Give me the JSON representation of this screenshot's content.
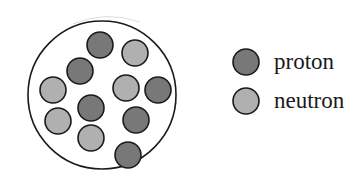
{
  "figure": {
    "width": 363,
    "height": 189,
    "background_color": "#ffffff"
  },
  "colors": {
    "proton_fill": "#787878",
    "neutron_fill": "#b0b0b0",
    "particle_stroke": "#1a1a1a",
    "nucleus_stroke": "#1a1a1a",
    "nucleus_fill": "#ffffff",
    "text_color": "#1a1a1a"
  },
  "nucleus": {
    "name": "nucleus-boundary",
    "center_x": 102,
    "center_y": 95,
    "radius": 74,
    "stroke_width": 1.6,
    "particle_radius": 13,
    "proton_count": 6,
    "neutron_count": 5,
    "total_nucleons": 11,
    "particles": [
      {
        "id": "p1",
        "type": "proton",
        "cx": 100,
        "cy": 45
      },
      {
        "id": "n1",
        "type": "neutron",
        "cx": 135,
        "cy": 53
      },
      {
        "id": "p2",
        "type": "proton",
        "cx": 80,
        "cy": 71
      },
      {
        "id": "n2",
        "type": "neutron",
        "cx": 53,
        "cy": 90
      },
      {
        "id": "n3",
        "type": "neutron",
        "cx": 126,
        "cy": 88
      },
      {
        "id": "p3",
        "type": "proton",
        "cx": 158,
        "cy": 90
      },
      {
        "id": "p4",
        "type": "proton",
        "cx": 91,
        "cy": 108
      },
      {
        "id": "n4",
        "type": "neutron",
        "cx": 58,
        "cy": 121
      },
      {
        "id": "p5",
        "type": "proton",
        "cx": 136,
        "cy": 120
      },
      {
        "id": "n5",
        "type": "neutron",
        "cx": 91,
        "cy": 138
      },
      {
        "id": "p6",
        "type": "proton",
        "cx": 128,
        "cy": 155
      }
    ]
  },
  "legend": {
    "name": "legend",
    "swatch_radius": 13,
    "items": [
      {
        "key": "proton",
        "label": "proton",
        "swatch_cx": 246,
        "swatch_cy": 62,
        "fill": "#787878"
      },
      {
        "key": "neutron",
        "label": "neutron",
        "swatch_cx": 246,
        "swatch_cy": 101,
        "fill": "#b0b0b0"
      }
    ]
  }
}
